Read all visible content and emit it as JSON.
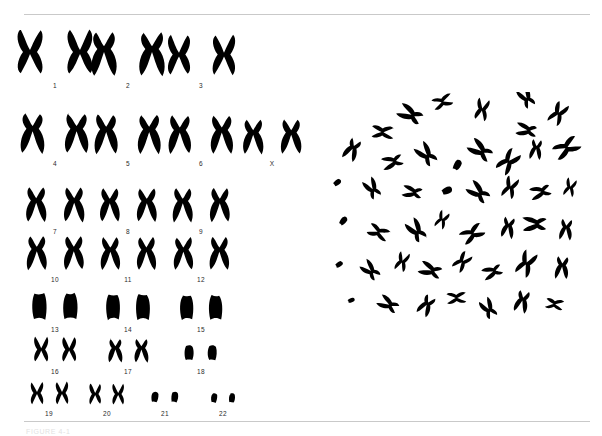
{
  "figure": {
    "caption": "FIGURE 4-1",
    "rule_color": "#c9c9c9",
    "background_color": "#ffffff",
    "ink_color": "#000000",
    "label_color": "#2b2b2b"
  },
  "karyotype": {
    "name": "human-karyotype",
    "description": "Giemsa-stained human karyotype arranged in seven rows of homologous chromosome pairs plus sex chromosomes",
    "total_labels": 23,
    "rows": [
      {
        "row_index": 1,
        "top": 20,
        "height": 58,
        "label_y": 50,
        "groups": [
          {
            "label": "1",
            "left": 22,
            "width": 66,
            "pair_scale": 1.0,
            "shape": "large-metacentric"
          },
          {
            "label": "2",
            "left": 95,
            "width": 66,
            "pair_scale": 0.95,
            "shape": "large-submetacentric"
          },
          {
            "label": "3",
            "left": 168,
            "width": 66,
            "pair_scale": 0.9,
            "shape": "large-metacentric"
          }
        ]
      },
      {
        "row_index": 2,
        "top": 108,
        "height": 48,
        "label_y": 40,
        "groups": [
          {
            "label": "4",
            "left": 22,
            "width": 66,
            "pair_scale": 0.88,
            "shape": "submetacentric"
          },
          {
            "label": "5",
            "left": 95,
            "width": 66,
            "pair_scale": 0.86,
            "shape": "submetacentric"
          },
          {
            "label": "6",
            "left": 168,
            "width": 66,
            "pair_scale": 0.84,
            "shape": "submetacentric"
          },
          {
            "label": "X",
            "left": 241,
            "width": 62,
            "pair_scale": 0.76,
            "shape": "submetacentric"
          }
        ]
      },
      {
        "row_index": 3,
        "top": 182,
        "height": 42,
        "label_y": 34,
        "groups": [
          {
            "label": "7",
            "left": 22,
            "width": 66,
            "pair_scale": 0.76,
            "shape": "submetacentric"
          },
          {
            "label": "8",
            "left": 95,
            "width": 66,
            "pair_scale": 0.74,
            "shape": "submetacentric"
          },
          {
            "label": "9",
            "left": 168,
            "width": 66,
            "pair_scale": 0.74,
            "shape": "submetacentric"
          }
        ]
      },
      {
        "row_index": 4,
        "top": 230,
        "height": 42,
        "label_y": 34,
        "groups": [
          {
            "label": "10",
            "left": 22,
            "width": 66,
            "pair_scale": 0.74,
            "shape": "submetacentric"
          },
          {
            "label": "11",
            "left": 95,
            "width": 66,
            "pair_scale": 0.72,
            "shape": "submetacentric"
          },
          {
            "label": "12",
            "left": 168,
            "width": 66,
            "pair_scale": 0.72,
            "shape": "submetacentric"
          }
        ]
      },
      {
        "row_index": 5,
        "top": 288,
        "height": 34,
        "label_y": 26,
        "groups": [
          {
            "label": "13",
            "left": 22,
            "width": 66,
            "pair_scale": 0.62,
            "shape": "acrocentric"
          },
          {
            "label": "14",
            "left": 95,
            "width": 66,
            "pair_scale": 0.6,
            "shape": "acrocentric"
          },
          {
            "label": "15",
            "left": 168,
            "width": 66,
            "pair_scale": 0.58,
            "shape": "acrocentric"
          }
        ]
      },
      {
        "row_index": 6,
        "top": 332,
        "height": 32,
        "label_y": 25,
        "groups": [
          {
            "label": "16",
            "left": 22,
            "width": 66,
            "pair_scale": 0.56,
            "shape": "metacentric"
          },
          {
            "label": "17",
            "left": 95,
            "width": 66,
            "pair_scale": 0.52,
            "shape": "submetacentric"
          },
          {
            "label": "18",
            "left": 168,
            "width": 66,
            "pair_scale": 0.46,
            "shape": "small"
          }
        ]
      },
      {
        "row_index": 7,
        "top": 376,
        "height": 30,
        "label_y": 24,
        "groups": [
          {
            "label": "19",
            "left": 22,
            "width": 54,
            "pair_scale": 0.5,
            "shape": "metacentric"
          },
          {
            "label": "20",
            "left": 80,
            "width": 54,
            "pair_scale": 0.46,
            "shape": "metacentric"
          },
          {
            "label": "21",
            "left": 138,
            "width": 54,
            "pair_scale": 0.4,
            "shape": "acrocentric-small"
          },
          {
            "label": "22",
            "left": 196,
            "width": 54,
            "pair_scale": 0.36,
            "shape": "acrocentric-small"
          }
        ]
      }
    ]
  },
  "metaphase_spread": {
    "name": "metaphase-chromosome-spread",
    "description": "Scattered metaphase spread of condensed chromosomes from a single cell",
    "chromosome_count": 46,
    "chromosomes": [
      {
        "x": 80,
        "y": 22,
        "r": 118,
        "s": 0.95,
        "t": "v"
      },
      {
        "x": 112,
        "y": 10,
        "r": 70,
        "s": 0.8,
        "t": "x"
      },
      {
        "x": 152,
        "y": 18,
        "r": 12,
        "s": 0.85,
        "t": "x"
      },
      {
        "x": 196,
        "y": 5,
        "r": 150,
        "s": 0.8,
        "t": "v"
      },
      {
        "x": 196,
        "y": 38,
        "r": 100,
        "s": 0.8,
        "t": "v"
      },
      {
        "x": 228,
        "y": 22,
        "r": 30,
        "s": 0.9,
        "t": "x"
      },
      {
        "x": 52,
        "y": 40,
        "r": 95,
        "s": 0.85,
        "t": "x"
      },
      {
        "x": 22,
        "y": 58,
        "r": 25,
        "s": 0.85,
        "t": "v"
      },
      {
        "x": 62,
        "y": 70,
        "r": 75,
        "s": 0.8,
        "t": "v"
      },
      {
        "x": 96,
        "y": 62,
        "r": 140,
        "s": 0.9,
        "t": "v"
      },
      {
        "x": 128,
        "y": 72,
        "r": 20,
        "s": 0.7,
        "t": "s"
      },
      {
        "x": 150,
        "y": 58,
        "r": 125,
        "s": 0.95,
        "t": "v"
      },
      {
        "x": 178,
        "y": 70,
        "r": 40,
        "s": 1.0,
        "t": "x"
      },
      {
        "x": 206,
        "y": 58,
        "r": 8,
        "s": 0.75,
        "t": "v"
      },
      {
        "x": 236,
        "y": 56,
        "r": 60,
        "s": 1.05,
        "t": "x"
      },
      {
        "x": 8,
        "y": 90,
        "r": 45,
        "s": 0.55,
        "t": "s"
      },
      {
        "x": 42,
        "y": 96,
        "r": 150,
        "s": 0.8,
        "t": "v"
      },
      {
        "x": 82,
        "y": 100,
        "r": 100,
        "s": 0.75,
        "t": "v"
      },
      {
        "x": 118,
        "y": 98,
        "r": 55,
        "s": 0.7,
        "t": "s"
      },
      {
        "x": 148,
        "y": 100,
        "r": 130,
        "s": 0.9,
        "t": "v"
      },
      {
        "x": 180,
        "y": 96,
        "r": 20,
        "s": 0.85,
        "t": "x"
      },
      {
        "x": 210,
        "y": 100,
        "r": 75,
        "s": 0.8,
        "t": "v"
      },
      {
        "x": 240,
        "y": 96,
        "r": 15,
        "s": 0.7,
        "t": "x"
      },
      {
        "x": 14,
        "y": 128,
        "r": 30,
        "s": 0.6,
        "t": "s"
      },
      {
        "x": 48,
        "y": 140,
        "r": 115,
        "s": 0.85,
        "t": "x"
      },
      {
        "x": 86,
        "y": 138,
        "r": 145,
        "s": 0.9,
        "t": "v"
      },
      {
        "x": 112,
        "y": 128,
        "r": 25,
        "s": 0.7,
        "t": "x"
      },
      {
        "x": 142,
        "y": 142,
        "r": 60,
        "s": 0.95,
        "t": "x"
      },
      {
        "x": 178,
        "y": 136,
        "r": 10,
        "s": 0.8,
        "t": "v"
      },
      {
        "x": 204,
        "y": 132,
        "r": 90,
        "s": 0.9,
        "t": "v"
      },
      {
        "x": 236,
        "y": 138,
        "r": 5,
        "s": 0.8,
        "t": "v"
      },
      {
        "x": 10,
        "y": 172,
        "r": 50,
        "s": 0.5,
        "t": "s"
      },
      {
        "x": 40,
        "y": 178,
        "r": 135,
        "s": 0.8,
        "t": "v"
      },
      {
        "x": 72,
        "y": 170,
        "r": 20,
        "s": 0.75,
        "t": "x"
      },
      {
        "x": 100,
        "y": 178,
        "r": 110,
        "s": 0.85,
        "t": "v"
      },
      {
        "x": 132,
        "y": 170,
        "r": 40,
        "s": 0.8,
        "t": "x"
      },
      {
        "x": 162,
        "y": 180,
        "r": 70,
        "s": 0.75,
        "t": "v"
      },
      {
        "x": 196,
        "y": 172,
        "r": 25,
        "s": 1.0,
        "t": "x"
      },
      {
        "x": 232,
        "y": 176,
        "r": 5,
        "s": 0.85,
        "t": "v"
      },
      {
        "x": 22,
        "y": 208,
        "r": 60,
        "s": 0.45,
        "t": "s"
      },
      {
        "x": 58,
        "y": 212,
        "r": 120,
        "s": 0.8,
        "t": "v"
      },
      {
        "x": 96,
        "y": 214,
        "r": 30,
        "s": 0.8,
        "t": "v"
      },
      {
        "x": 126,
        "y": 206,
        "r": 85,
        "s": 0.75,
        "t": "x"
      },
      {
        "x": 158,
        "y": 216,
        "r": 150,
        "s": 0.8,
        "t": "v"
      },
      {
        "x": 192,
        "y": 210,
        "r": 15,
        "s": 0.85,
        "t": "v"
      },
      {
        "x": 224,
        "y": 212,
        "r": 100,
        "s": 0.7,
        "t": "x"
      }
    ]
  }
}
